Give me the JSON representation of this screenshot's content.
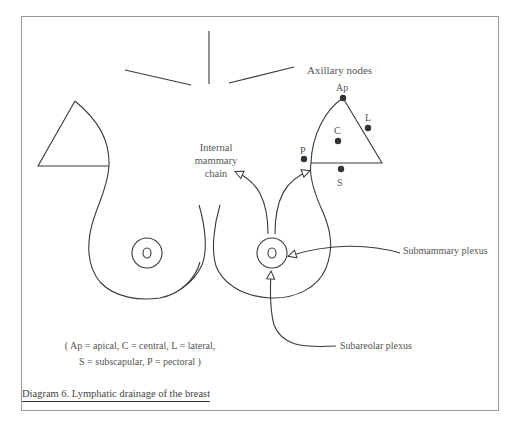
{
  "diagram": {
    "caption": "Diagram 6. Lymphatic drainage of the breast",
    "labels": {
      "axillary_nodes": "Axillary nodes",
      "internal_mammary_line1": "Internal",
      "internal_mammary_line2": "mammary",
      "internal_mammary_line3": "chain",
      "submammary_plexus": "Submammary plexus",
      "subareolar_plexus": "Subareolar plexus"
    },
    "nodes": [
      {
        "id": "Ap",
        "label": "Ap",
        "meaning": "apical"
      },
      {
        "id": "C",
        "label": "C",
        "meaning": "central"
      },
      {
        "id": "L",
        "label": "L",
        "meaning": "lateral"
      },
      {
        "id": "S",
        "label": "S",
        "meaning": "subscapular"
      },
      {
        "id": "P",
        "label": "P",
        "meaning": "pectoral"
      }
    ],
    "legend": {
      "line1": "( Ap = apical, C = central, L = lateral,",
      "line2": "S = subscapular, P = pectoral )"
    },
    "colors": {
      "stroke": "#3a3a3a",
      "node_fill": "#333333",
      "text": "#555555",
      "frame": "#9a9a9a"
    }
  }
}
